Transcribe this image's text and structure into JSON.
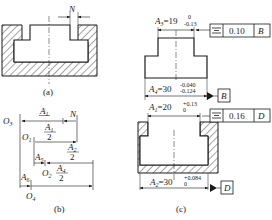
{
  "figure": {
    "panels": [
      {
        "id": "a",
        "caption": "(a)",
        "labels": {
          "gap": "N"
        }
      },
      {
        "id": "b",
        "caption": "(b)",
        "points": [
          "O3",
          "O1",
          "O2",
          "O4"
        ],
        "chain": [
          {
            "name": "A1/2",
            "num": "A",
            "sub": "1",
            "den": "2"
          },
          {
            "name": "A2/2",
            "num": "A",
            "sub": "2",
            "den": "2"
          },
          {
            "name": "A4/2",
            "num": "A",
            "sub": "4",
            "den": "2"
          },
          {
            "name": "A5",
            "base": "A",
            "sub": "5"
          },
          {
            "name": "A6",
            "base": "A",
            "sub": "6"
          },
          {
            "name": "N",
            "base": "N"
          }
        ]
      },
      {
        "id": "c",
        "caption": "(c)",
        "dims": [
          {
            "name": "A3",
            "base": "A",
            "sub": "3",
            "nominal": "=19",
            "upper": "0",
            "lower": "-0.13"
          },
          {
            "name": "A4",
            "base": "A",
            "sub": "4",
            "nominal": "=30",
            "upper": "-0.040",
            "lower": "-0.124"
          },
          {
            "name": "A1",
            "base": "A",
            "sub": "1",
            "nominal": "=20",
            "upper": "+0.13",
            "lower": "0"
          },
          {
            "name": "A2",
            "base": "A",
            "sub": "2",
            "nominal": "=30",
            "upper": "+0.084",
            "lower": "0"
          }
        ],
        "tolerance_frames": [
          {
            "symbol": "⌯",
            "symbol_name": "symmetry",
            "value": "0.10",
            "datum": "B"
          },
          {
            "symbol": "⌯",
            "symbol_name": "symmetry",
            "value": "0.16",
            "datum": "D"
          }
        ],
        "datums": [
          "B",
          "D"
        ]
      }
    ]
  }
}
